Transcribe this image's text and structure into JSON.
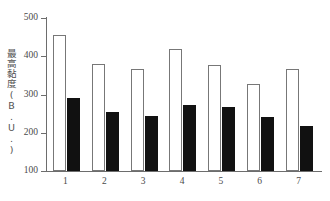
{
  "chart_data": {
    "type": "bar",
    "title": "",
    "subtitle": "",
    "xlabel": "",
    "ylabel": "最高黏度(B.U.)",
    "categories": [
      "1",
      "2",
      "3",
      "4",
      "5",
      "6",
      "7"
    ],
    "series": [
      {
        "name": "open-bar",
        "style": "white-open",
        "values": [
          455,
          380,
          368,
          418,
          378,
          328,
          367
        ]
      },
      {
        "name": "filled-bar",
        "style": "black-filled",
        "values": [
          291,
          253,
          243,
          273,
          267,
          242,
          217
        ]
      }
    ],
    "ylim": [
      100,
      500
    ],
    "y_ticks": [
      100,
      200,
      300,
      400,
      500
    ],
    "y_tick_labels": [
      "100",
      "200",
      "300",
      "400",
      "500"
    ],
    "x_tick_labels": [
      "1",
      "2",
      "3",
      "4",
      "5",
      "6",
      "7"
    ],
    "grid": false,
    "legend": false,
    "legend_position": "none",
    "axis_color": "#6d6d6d",
    "open_bar_color": "#ffffff",
    "open_bar_border_color": "#777777",
    "filled_bar_color": "#111111",
    "background_color": "#ffffff"
  }
}
